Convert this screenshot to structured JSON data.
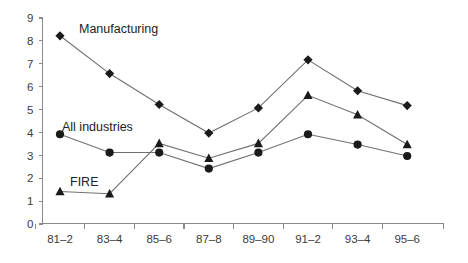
{
  "chart_data": {
    "type": "line",
    "title": "",
    "subtitle": "",
    "xlabel": "",
    "ylabel": "",
    "categories": [
      "81–2",
      "83–4",
      "85–6",
      "87–8",
      "89–90",
      "91–2",
      "93–4",
      "95–6"
    ],
    "ylim": [
      0,
      9
    ],
    "ytick_labels": [
      "0",
      "1",
      "2",
      "3",
      "4",
      "5",
      "6",
      "7",
      "8",
      "9"
    ],
    "ytick_values": [
      0,
      1,
      2,
      3,
      4,
      5,
      6,
      7,
      8,
      9
    ],
    "grid": false,
    "legend_position": "inline-annotations",
    "series": [
      {
        "name": "Manufacturing",
        "marker": "diamond",
        "values": [
          8.2,
          6.55,
          5.2,
          3.95,
          5.05,
          7.15,
          5.8,
          5.15
        ]
      },
      {
        "name": "All industries",
        "marker": "circle",
        "values": [
          3.9,
          3.1,
          3.1,
          2.4,
          3.1,
          3.9,
          3.45,
          2.95
        ]
      },
      {
        "name": "FIRE",
        "marker": "triangle",
        "values": [
          1.4,
          1.3,
          3.5,
          2.85,
          3.5,
          5.6,
          4.75,
          3.45
        ]
      }
    ],
    "annotations": [
      {
        "text": "Manufacturing",
        "x_px": 79,
        "y_px": 33
      },
      {
        "text": "All industries",
        "x_px": 62,
        "y_px": 131
      },
      {
        "text": "FIRE",
        "x_px": 70,
        "y_px": 186
      }
    ],
    "colors": {
      "marker": "#1a1a1a",
      "line": "#707070",
      "axis": "#8a8a8a",
      "text": "#3b3b3b",
      "background": "#ffffff"
    }
  }
}
